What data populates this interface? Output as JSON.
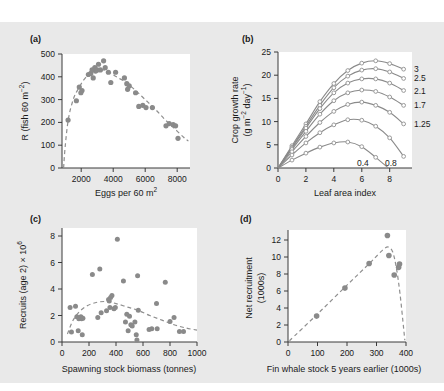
{
  "figure": {
    "background_color": "#e9e9e9",
    "panel_color": "#ffffff",
    "marker_color": "#8a8a8a",
    "line_color": "#8f8f8f"
  },
  "panels": {
    "a": {
      "tag": "(a)",
      "xlabel": "Eggs per 60 m",
      "xlabel_sup": "2",
      "ylabel_main": "R (fish 60 m",
      "ylabel_sup": "−2",
      "ylabel_close": ")",
      "xticks": [
        "2000",
        "4000",
        "6000",
        "8000"
      ],
      "yticks": [
        "0",
        "100",
        "200",
        "300",
        "400",
        "500"
      ],
      "xlim": [
        800,
        8800
      ],
      "ylim": [
        0,
        500
      ]
    },
    "b": {
      "tag": "(b)",
      "xlabel": "Leaf area index",
      "ylabel_line1": "Crop growth rate",
      "ylabel_line2_a": "(g m",
      "ylabel_line2_sup1": "−2",
      "ylabel_line2_b": "day",
      "ylabel_line2_sup2": "−1",
      "ylabel_line2_c": ")",
      "xticks": [
        "0",
        "2",
        "4",
        "6",
        "8"
      ],
      "yticks": [
        "0",
        "5",
        "10",
        "15",
        "20",
        "25"
      ],
      "xlim": [
        0,
        9.6
      ],
      "ylim": [
        0,
        25
      ],
      "legend": [
        "3",
        "2.5",
        "2.1",
        "1.7",
        "1.25",
        "0.4",
        "0.8"
      ]
    },
    "c": {
      "tag": "(c)",
      "xlabel": "Spawning stock biomass (tonnes)",
      "ylabel_main": "Recruits (age 2) × 10",
      "ylabel_sup": "6",
      "xticks": [
        "0",
        "200",
        "400",
        "600",
        "800",
        "1000"
      ],
      "yticks": [
        "0",
        "2",
        "4",
        "6",
        "8"
      ],
      "xlim": [
        0,
        1000
      ],
      "ylim": [
        0,
        8.6
      ]
    },
    "d": {
      "tag": "(d)",
      "xlabel": "Fin whale stock 5 years earlier (1000s)",
      "ylabel_line1": "Net recruitment",
      "ylabel_line2": "(1000s)",
      "xticks": [
        "0",
        "100",
        "200",
        "300",
        "400"
      ],
      "yticks": [
        "0",
        "2",
        "4",
        "6",
        "8",
        "10",
        "12"
      ],
      "xlim": [
        0,
        400
      ],
      "ylim": [
        0,
        13.2
      ]
    }
  },
  "chart_data": [
    {
      "type": "scatter",
      "panel": "a",
      "title": "(a)",
      "xlabel": "Eggs per 60 m2",
      "ylabel": "R (fish 60 m-2)",
      "xlim": [
        800,
        8800
      ],
      "ylim": [
        0,
        500
      ],
      "xticks": [
        2000,
        4000,
        6000,
        8000
      ],
      "yticks": [
        0,
        100,
        200,
        300,
        400,
        500
      ],
      "grid": false,
      "legend": null,
      "points": [
        [
          1180,
          210
        ],
        [
          1700,
          295
        ],
        [
          1880,
          355
        ],
        [
          1980,
          330
        ],
        [
          2050,
          340
        ],
        [
          2450,
          410
        ],
        [
          2600,
          415
        ],
        [
          2680,
          430
        ],
        [
          2750,
          395
        ],
        [
          2850,
          440
        ],
        [
          2900,
          425
        ],
        [
          3000,
          430
        ],
        [
          3080,
          455
        ],
        [
          3200,
          430
        ],
        [
          3400,
          470
        ],
        [
          3500,
          440
        ],
        [
          3700,
          420
        ],
        [
          3850,
          375
        ],
        [
          4150,
          420
        ],
        [
          4700,
          395
        ],
        [
          4850,
          370
        ],
        [
          4900,
          345
        ],
        [
          5000,
          360
        ],
        [
          5400,
          330
        ],
        [
          5600,
          270
        ],
        [
          5850,
          275
        ],
        [
          6050,
          265
        ],
        [
          6450,
          265
        ],
        [
          7300,
          185
        ],
        [
          7500,
          195
        ],
        [
          7750,
          190
        ],
        [
          7900,
          185
        ],
        [
          8050,
          130
        ]
      ],
      "fit_curve": {
        "style": "dashed",
        "description": "Ricker-type stock-recruitment curve rising to peak ~430 near 3200 eggs then declining",
        "points": [
          [
            900,
            0
          ],
          [
            1000,
            95
          ],
          [
            1200,
            215
          ],
          [
            1500,
            300
          ],
          [
            1800,
            345
          ],
          [
            2200,
            390
          ],
          [
            2600,
            415
          ],
          [
            3000,
            428
          ],
          [
            3400,
            430
          ],
          [
            3800,
            418
          ],
          [
            4200,
            400
          ],
          [
            4800,
            375
          ],
          [
            5400,
            340
          ],
          [
            6000,
            300
          ],
          [
            6600,
            260
          ],
          [
            7200,
            215
          ],
          [
            7800,
            175
          ],
          [
            8400,
            135
          ],
          [
            8700,
            118
          ]
        ]
      }
    },
    {
      "type": "line",
      "panel": "b",
      "title": "(b)",
      "xlabel": "Leaf area index",
      "ylabel": "Crop growth rate (g m-2 day-1)",
      "xlim": [
        0,
        9.6
      ],
      "ylim": [
        0,
        25
      ],
      "xticks": [
        0,
        2,
        4,
        6,
        8
      ],
      "yticks": [
        0,
        5,
        10,
        15,
        20,
        25
      ],
      "grid": false,
      "legend_position": "right-inline",
      "x": [
        0,
        1,
        2,
        3,
        4,
        5,
        6,
        7,
        8,
        9
      ],
      "series": [
        {
          "name": "3",
          "values": [
            0,
            4.8,
            9.5,
            14.3,
            18.2,
            21.0,
            22.6,
            23.1,
            22.5,
            21.3
          ]
        },
        {
          "name": "2.5",
          "values": [
            0,
            4.5,
            9.0,
            13.5,
            17.3,
            19.8,
            21.1,
            21.4,
            20.7,
            19.3
          ]
        },
        {
          "name": "2.1",
          "values": [
            0,
            4.3,
            8.6,
            12.8,
            16.2,
            18.3,
            19.2,
            19.2,
            18.3,
            16.7
          ]
        },
        {
          "name": "1.7",
          "values": [
            0,
            4.0,
            7.9,
            11.6,
            14.5,
            16.2,
            16.8,
            16.5,
            15.3,
            13.5
          ]
        },
        {
          "name": "1.25",
          "values": [
            0,
            3.5,
            6.8,
            9.8,
            12.2,
            13.7,
            14.2,
            13.5,
            12.0,
            9.5
          ]
        },
        {
          "name": "0.8",
          "values": [
            0,
            2.8,
            5.4,
            7.6,
            9.3,
            10.4,
            10.3,
            9.0,
            6.5,
            2.5
          ]
        },
        {
          "name": "0.4",
          "values": [
            0,
            1.7,
            3.2,
            4.5,
            5.4,
            5.6,
            4.6,
            2.3,
            null,
            null
          ]
        }
      ],
      "marker": "open-circle"
    },
    {
      "type": "scatter",
      "panel": "c",
      "title": "(c)",
      "xlabel": "Spawning stock biomass (tonnes)",
      "ylabel": "Recruits (age 2) x 10^6",
      "xlim": [
        0,
        1000
      ],
      "ylim": [
        0,
        8.6
      ],
      "xticks": [
        0,
        200,
        400,
        600,
        800,
        1000
      ],
      "yticks": [
        0,
        2,
        4,
        6,
        8
      ],
      "grid": false,
      "legend": null,
      "points": [
        [
          60,
          2.6
        ],
        [
          70,
          0.75
        ],
        [
          100,
          2.7
        ],
        [
          110,
          1.9
        ],
        [
          120,
          0.85
        ],
        [
          125,
          1.75
        ],
        [
          140,
          1.9
        ],
        [
          145,
          1.75
        ],
        [
          150,
          0.55
        ],
        [
          155,
          1.8
        ],
        [
          225,
          5.1
        ],
        [
          265,
          1.85
        ],
        [
          280,
          5.5
        ],
        [
          290,
          2.2
        ],
        [
          330,
          2.35
        ],
        [
          345,
          3.2
        ],
        [
          350,
          3.1
        ],
        [
          355,
          2.6
        ],
        [
          360,
          3.35
        ],
        [
          370,
          3.5
        ],
        [
          385,
          2.5
        ],
        [
          395,
          2.6
        ],
        [
          410,
          7.75
        ],
        [
          455,
          4.6
        ],
        [
          470,
          1.5
        ],
        [
          480,
          2.1
        ],
        [
          490,
          0.85
        ],
        [
          500,
          1.95
        ],
        [
          510,
          1.3
        ],
        [
          520,
          1.2
        ],
        [
          540,
          1.5
        ],
        [
          550,
          0.55
        ],
        [
          555,
          0.15
        ],
        [
          560,
          5.0
        ],
        [
          565,
          2.4
        ],
        [
          645,
          0.95
        ],
        [
          665,
          1.0
        ],
        [
          700,
          2.9
        ],
        [
          705,
          1.0
        ],
        [
          765,
          4.5
        ],
        [
          800,
          1.55
        ],
        [
          830,
          1.85
        ],
        [
          870,
          0.8
        ],
        [
          900,
          0.8
        ]
      ],
      "fit_curve": {
        "style": "dashed",
        "description": "Dome-shaped stock-recruitment curve peaking ~3.1 near 330 tonnes then gently declining to ~0.9 at 1000",
        "points": [
          [
            40,
            0.6
          ],
          [
            80,
            1.6
          ],
          [
            130,
            2.3
          ],
          [
            190,
            2.75
          ],
          [
            260,
            3.0
          ],
          [
            330,
            3.05
          ],
          [
            400,
            2.9
          ],
          [
            480,
            2.65
          ],
          [
            560,
            2.4
          ],
          [
            650,
            2.0
          ],
          [
            740,
            1.65
          ],
          [
            830,
            1.3
          ],
          [
            920,
            1.05
          ],
          [
            1000,
            0.9
          ]
        ]
      }
    },
    {
      "type": "scatter",
      "panel": "d",
      "title": "(d)",
      "xlabel": "Fin whale stock 5 years earlier (1000s)",
      "ylabel": "Net recruitment (1000s)",
      "xlim": [
        0,
        400
      ],
      "ylim": [
        0,
        13.2
      ],
      "xticks": [
        0,
        100,
        200,
        300,
        400
      ],
      "yticks": [
        0,
        2,
        4,
        6,
        8,
        10,
        12
      ],
      "grid": false,
      "legend": null,
      "points": [
        [
          97,
          3.05
        ],
        [
          193,
          6.35
        ],
        [
          275,
          9.25
        ],
        [
          337,
          12.55
        ],
        [
          342,
          10.2
        ],
        [
          360,
          7.9
        ],
        [
          375,
          8.8
        ],
        [
          378,
          9.2
        ]
      ],
      "fit_curve": {
        "style": "dashed",
        "description": "Linear rise from origin to peak ~11.2 near 340 then steep decline to 0 at ~395",
        "points": [
          [
            5,
            0.15
          ],
          [
            100,
            3.3
          ],
          [
            200,
            6.7
          ],
          [
            280,
            9.4
          ],
          [
            320,
            10.8
          ],
          [
            340,
            11.2
          ],
          [
            355,
            10.6
          ],
          [
            368,
            8.6
          ],
          [
            380,
            5.6
          ],
          [
            392,
            1.6
          ],
          [
            396,
            0.2
          ]
        ]
      }
    }
  ]
}
